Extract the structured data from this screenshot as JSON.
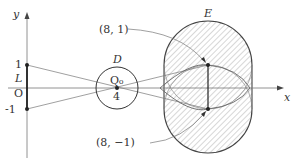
{
  "axes": {
    "x_label": "x",
    "y_label": "y",
    "origin_label": "O",
    "y_ticks": [
      "1",
      "-1"
    ]
  },
  "segment_L": {
    "label": "L",
    "from": [
      0,
      1
    ],
    "to": [
      0,
      -1
    ]
  },
  "circle_D": {
    "label": "D",
    "center_label": "Q₀",
    "center_x_label": "4",
    "center": [
      4,
      0
    ]
  },
  "region_E": {
    "label": "E",
    "style": "hatched"
  },
  "points": [
    {
      "label": "(8, 1)",
      "coords": [
        8,
        1
      ]
    },
    {
      "label": "(8, −1)",
      "coords": [
        8,
        -1
      ]
    }
  ],
  "colors": {
    "stroke": "#333333",
    "light_stroke": "#888888",
    "hatch": "#999999"
  }
}
